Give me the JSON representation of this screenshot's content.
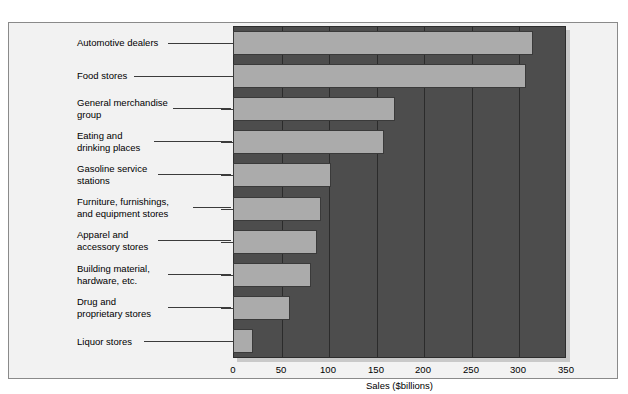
{
  "chart_data": {
    "type": "bar",
    "orientation": "horizontal",
    "title": "",
    "xlabel": "Sales ($billions)",
    "ylabel": "",
    "xlim": [
      0,
      350
    ],
    "xticks": [
      0,
      50,
      100,
      150,
      200,
      250,
      300,
      350
    ],
    "xticklabels": [
      "0",
      "50",
      "100",
      "150",
      "200",
      "250",
      "300",
      "350"
    ],
    "grid": true,
    "grid_axis": "x",
    "legend": false,
    "categories": [
      "Automotive dealers",
      "Food stores",
      "General merchandise\ngroup",
      "Eating and\ndrinking places",
      "Gasoline service\nstations",
      "Furniture, furnishings,\nand equipment stores",
      "Apparel and\naccessory stores",
      "Building material,\nhardware, etc.",
      "Drug and\nproprietary stores",
      "Liquor stores"
    ],
    "values": [
      315,
      308,
      170,
      159,
      103,
      93,
      88,
      82,
      60,
      21
    ],
    "colors": {
      "bar_fill": "#ababab",
      "bar_edge": "#3a3a3a",
      "plot_background": "#4d4d4d",
      "gridline": "#2b2b2b",
      "figure_background": "#f2f2f2",
      "text": "#000000"
    }
  },
  "axis": {
    "title": "Sales ($billions)"
  }
}
